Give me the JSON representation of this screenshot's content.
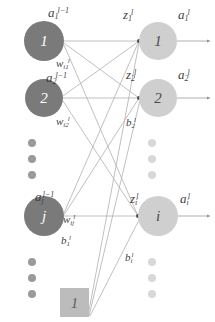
{
  "diagram": {
    "colors": {
      "left_node_fill": "#7a7a7a",
      "right_node_fill": "#cfcfcf",
      "left_dot_fill": "#9a9a9a",
      "right_dot_fill": "#d8d8d8",
      "bias_box_fill": "#bcbcbc",
      "edge_stroke": "#b0b0b0",
      "axis_stroke": "#9a9a9a",
      "label_color": "#3f3f3f",
      "background": "#ffffff"
    },
    "left_layer": {
      "name": "previous-layer",
      "nodes": [
        {
          "id": "l1",
          "number": "1",
          "label_base": "a",
          "label_sub": "1",
          "label_sup": "l−1",
          "cx": 44,
          "cy": 41,
          "r": 20
        },
        {
          "id": "l2",
          "number": "2",
          "label_base": "a",
          "label_sub": "2",
          "label_sup": "l−1",
          "cx": 44,
          "cy": 98,
          "r": 19
        },
        {
          "id": "lj",
          "number": "j",
          "label_base": "a",
          "label_sub": "j",
          "label_sup": "l−1",
          "cx": 44,
          "cy": 216,
          "r": 20
        }
      ],
      "ellipsis_dots": [
        {
          "cx": 32,
          "cy": 143,
          "r": 4
        },
        {
          "cx": 32,
          "cy": 159,
          "r": 4
        },
        {
          "cx": 32,
          "cy": 175,
          "r": 4
        },
        {
          "cx": 32,
          "cy": 262,
          "r": 4
        },
        {
          "cx": 32,
          "cy": 278,
          "r": 4
        },
        {
          "cx": 32,
          "cy": 294,
          "r": 4
        }
      ]
    },
    "right_layer": {
      "name": "current-layer",
      "nodes": [
        {
          "id": "r1",
          "number": "1",
          "z_base": "z",
          "z_sub": "1",
          "z_sup": "l",
          "a_base": "a",
          "a_sub": "1",
          "a_sup": "l",
          "cx": 158,
          "cy": 41,
          "r": 19
        },
        {
          "id": "r2",
          "number": "2",
          "z_base": "z",
          "z_sub": "2",
          "z_sup": "l",
          "a_base": "a",
          "a_sub": "2",
          "a_sup": "l",
          "cx": 158,
          "cy": 98,
          "r": 19
        },
        {
          "id": "ri",
          "number": "i",
          "z_base": "z",
          "z_sub": "i",
          "z_sup": "l",
          "a_base": "a",
          "a_sub": "i",
          "a_sup": "l",
          "cx": 158,
          "cy": 216,
          "r": 20
        }
      ],
      "ellipsis_dots": [
        {
          "cx": 152,
          "cy": 143,
          "r": 4
        },
        {
          "cx": 152,
          "cy": 159,
          "r": 4
        },
        {
          "cx": 152,
          "cy": 175,
          "r": 4
        },
        {
          "cx": 152,
          "cy": 262,
          "r": 4
        },
        {
          "cx": 152,
          "cy": 278,
          "r": 4
        },
        {
          "cx": 152,
          "cy": 294,
          "r": 4
        }
      ]
    },
    "bias_unit": {
      "name": "bias-node",
      "value": "1",
      "x": 60,
      "y": 288,
      "width": 29,
      "height": 29
    },
    "labels": {
      "a1_prev": {
        "base": "a",
        "sub": "1",
        "sup": "l−1",
        "x": 48,
        "y": 4
      },
      "a2_prev": {
        "base": "a",
        "sub": "2",
        "sup": "l−1",
        "x": 46,
        "y": 69
      },
      "aj_prev": {
        "base": "a",
        "sub": "j",
        "sup": "l−1",
        "x": 35,
        "y": 188
      },
      "z1": {
        "base": "z",
        "sub": "1",
        "sup": "l",
        "x": 123,
        "y": 6
      },
      "z2": {
        "base": "z",
        "sub": "2",
        "sup": "l",
        "x": 126,
        "y": 66
      },
      "zi": {
        "base": "z",
        "sub": "i",
        "sup": "l",
        "x": 130,
        "y": 190
      },
      "a1": {
        "base": "a",
        "sub": "1",
        "sup": "l",
        "x": 178,
        "y": 6
      },
      "a2": {
        "base": "a",
        "sub": "2",
        "sup": "l",
        "x": 178,
        "y": 66
      },
      "ai": {
        "base": "a",
        "sub": "i",
        "sup": "l",
        "x": 180,
        "y": 190
      },
      "w_i1": {
        "base": "w",
        "sub": "i1",
        "sup": "l",
        "x": 56,
        "y": 54
      },
      "w_i2": {
        "base": "w",
        "sub": "i2",
        "sup": "l",
        "x": 56,
        "y": 112
      },
      "w_ij": {
        "base": "w",
        "sub": "ij",
        "sup": "l",
        "x": 63,
        "y": 210
      },
      "b_2": {
        "base": "b",
        "sub": "2",
        "sup": "l",
        "x": 126,
        "y": 113
      },
      "b_1": {
        "base": "b",
        "sub": "1",
        "sup": "l",
        "x": 61,
        "y": 231
      },
      "b_i": {
        "base": "b",
        "sub": "i",
        "sup": "l",
        "x": 125,
        "y": 248
      }
    },
    "edges": {
      "description": "fully connected weight lines from left nodes to right nodes, bias lines from bias unit, and output arrows",
      "weight_lines": [
        {
          "from": "l1",
          "to": "r1"
        },
        {
          "from": "l1",
          "to": "r2"
        },
        {
          "from": "l1",
          "to": "ri"
        },
        {
          "from": "l2",
          "to": "r1"
        },
        {
          "from": "l2",
          "to": "r2"
        },
        {
          "from": "l2",
          "to": "ri"
        },
        {
          "from": "lj",
          "to": "r1"
        },
        {
          "from": "lj",
          "to": "r2"
        },
        {
          "from": "lj",
          "to": "ri"
        }
      ],
      "bias_lines": [
        {
          "from": "bias",
          "to": "r1"
        },
        {
          "from": "bias",
          "to": "r2"
        },
        {
          "from": "bias",
          "to": "ri"
        }
      ],
      "output_arrows": [
        {
          "from": "r1"
        },
        {
          "from": "r2"
        },
        {
          "from": "ri"
        }
      ]
    }
  }
}
